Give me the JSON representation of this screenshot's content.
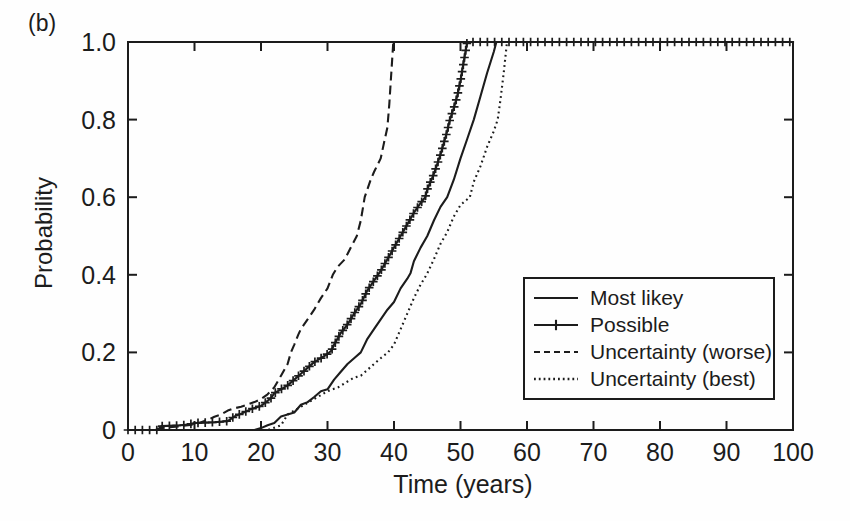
{
  "figure": {
    "panel_label": "(b)",
    "ink_color": "#1c1c1c",
    "paper_color": "#fefefe"
  },
  "chart_data": {
    "type": "line",
    "title": "",
    "xlabel": "Time (years)",
    "ylabel": "Probability",
    "xlim": [
      0,
      100
    ],
    "ylim": [
      0,
      1.0
    ],
    "x_ticks": [
      0,
      10,
      20,
      30,
      40,
      50,
      60,
      70,
      80,
      90,
      100
    ],
    "y_ticks": [
      0,
      0.2,
      0.4,
      0.6,
      0.8,
      1.0
    ],
    "y_tick_labels": [
      "0",
      "0.2",
      "0.4",
      "0.6",
      "0.8",
      "1.0"
    ],
    "grid": false,
    "legend_position": "inside lower-right",
    "series": [
      {
        "name": "Most likey",
        "line_style": "solid",
        "marker": "none",
        "points": [
          [
            0,
            0
          ],
          [
            19,
            0
          ],
          [
            20,
            0.005
          ],
          [
            21,
            0.012
          ],
          [
            22,
            0.018
          ],
          [
            23,
            0.035
          ],
          [
            24,
            0.04
          ],
          [
            25,
            0.045
          ],
          [
            26,
            0.065
          ],
          [
            27,
            0.072
          ],
          [
            28,
            0.085
          ],
          [
            29,
            0.1
          ],
          [
            30,
            0.105
          ],
          [
            31,
            0.13
          ],
          [
            32,
            0.15
          ],
          [
            33,
            0.17
          ],
          [
            34,
            0.185
          ],
          [
            35,
            0.2
          ],
          [
            36,
            0.235
          ],
          [
            37,
            0.26
          ],
          [
            38,
            0.285
          ],
          [
            39,
            0.31
          ],
          [
            40,
            0.33
          ],
          [
            41,
            0.365
          ],
          [
            42,
            0.39
          ],
          [
            42.5,
            0.405
          ],
          [
            43,
            0.435
          ],
          [
            44,
            0.47
          ],
          [
            45,
            0.5
          ],
          [
            46,
            0.54
          ],
          [
            47,
            0.575
          ],
          [
            48,
            0.6
          ],
          [
            49,
            0.645
          ],
          [
            50,
            0.7
          ],
          [
            51,
            0.75
          ],
          [
            52,
            0.8
          ],
          [
            53,
            0.86
          ],
          [
            54,
            0.92
          ],
          [
            55,
            0.975
          ],
          [
            55.4,
            1
          ],
          [
            100,
            1
          ]
        ]
      },
      {
        "name": "Possible",
        "line_style": "solid",
        "marker": "plus",
        "points": [
          [
            0,
            0
          ],
          [
            4.5,
            0
          ],
          [
            5,
            0.01
          ],
          [
            8,
            0.012
          ],
          [
            9,
            0.014
          ],
          [
            10,
            0.018
          ],
          [
            13,
            0.02
          ],
          [
            15,
            0.023
          ],
          [
            16,
            0.035
          ],
          [
            17,
            0.042
          ],
          [
            18,
            0.05
          ],
          [
            19,
            0.057
          ],
          [
            20,
            0.062
          ],
          [
            20.6,
            0.07
          ],
          [
            21.5,
            0.082
          ],
          [
            22,
            0.095
          ],
          [
            23,
            0.105
          ],
          [
            24,
            0.115
          ],
          [
            25,
            0.13
          ],
          [
            26,
            0.145
          ],
          [
            27,
            0.16
          ],
          [
            28,
            0.175
          ],
          [
            29,
            0.185
          ],
          [
            30,
            0.196
          ],
          [
            30.6,
            0.205
          ],
          [
            31,
            0.22
          ],
          [
            32,
            0.25
          ],
          [
            33,
            0.272
          ],
          [
            34,
            0.3
          ],
          [
            35,
            0.325
          ],
          [
            36,
            0.36
          ],
          [
            37,
            0.385
          ],
          [
            38,
            0.41
          ],
          [
            39,
            0.44
          ],
          [
            40,
            0.47
          ],
          [
            41,
            0.5
          ],
          [
            42,
            0.53
          ],
          [
            43,
            0.56
          ],
          [
            44,
            0.585
          ],
          [
            44.7,
            0.6
          ],
          [
            45,
            0.62
          ],
          [
            46,
            0.66
          ],
          [
            47,
            0.71
          ],
          [
            48,
            0.77
          ],
          [
            48.4,
            0.8
          ],
          [
            49,
            0.83
          ],
          [
            49.5,
            0.86
          ],
          [
            50,
            0.9
          ],
          [
            50.5,
            0.95
          ],
          [
            51,
            1
          ],
          [
            100,
            1
          ]
        ]
      },
      {
        "name": "Uncertainty (worse)",
        "line_style": "dashed",
        "marker": "none",
        "points": [
          [
            0,
            0
          ],
          [
            4,
            0
          ],
          [
            5,
            0.005
          ],
          [
            8,
            0.01
          ],
          [
            10,
            0.014
          ],
          [
            11,
            0.02
          ],
          [
            12,
            0.026
          ],
          [
            13,
            0.034
          ],
          [
            14,
            0.04
          ],
          [
            15,
            0.05
          ],
          [
            16,
            0.056
          ],
          [
            17,
            0.06
          ],
          [
            18,
            0.066
          ],
          [
            19,
            0.072
          ],
          [
            20,
            0.08
          ],
          [
            21,
            0.092
          ],
          [
            22,
            0.11
          ],
          [
            23,
            0.14
          ],
          [
            24,
            0.17
          ],
          [
            24.5,
            0.2
          ],
          [
            25,
            0.22
          ],
          [
            25.6,
            0.245
          ],
          [
            26,
            0.26
          ],
          [
            27,
            0.285
          ],
          [
            28,
            0.31
          ],
          [
            29,
            0.34
          ],
          [
            30,
            0.365
          ],
          [
            30.8,
            0.4
          ],
          [
            31.5,
            0.42
          ],
          [
            32.6,
            0.44
          ],
          [
            33.5,
            0.47
          ],
          [
            34.4,
            0.5
          ],
          [
            35,
            0.54
          ],
          [
            35.6,
            0.6
          ],
          [
            36.5,
            0.645
          ],
          [
            37,
            0.665
          ],
          [
            38,
            0.7
          ],
          [
            38.5,
            0.74
          ],
          [
            39,
            0.78
          ],
          [
            39.3,
            0.84
          ],
          [
            39.6,
            0.92
          ],
          [
            39.9,
            1
          ],
          [
            100,
            1
          ]
        ]
      },
      {
        "name": "Uncertainty (best)",
        "line_style": "dotted",
        "marker": "none",
        "points": [
          [
            0,
            0
          ],
          [
            21,
            0
          ],
          [
            22,
            0.006
          ],
          [
            23,
            0.012
          ],
          [
            24,
            0.04
          ],
          [
            25,
            0.05
          ],
          [
            26,
            0.06
          ],
          [
            27,
            0.07
          ],
          [
            28,
            0.08
          ],
          [
            29,
            0.09
          ],
          [
            30,
            0.1
          ],
          [
            31.6,
            0.11
          ],
          [
            33,
            0.125
          ],
          [
            34,
            0.135
          ],
          [
            35,
            0.14
          ],
          [
            36,
            0.155
          ],
          [
            37,
            0.17
          ],
          [
            38,
            0.185
          ],
          [
            39.1,
            0.2
          ],
          [
            40,
            0.22
          ],
          [
            41,
            0.26
          ],
          [
            42,
            0.3
          ],
          [
            43,
            0.34
          ],
          [
            44,
            0.375
          ],
          [
            44.9,
            0.4
          ],
          [
            46,
            0.44
          ],
          [
            47,
            0.48
          ],
          [
            48,
            0.51
          ],
          [
            49,
            0.55
          ],
          [
            50,
            0.58
          ],
          [
            51.4,
            0.6
          ],
          [
            52,
            0.64
          ],
          [
            53,
            0.68
          ],
          [
            54,
            0.73
          ],
          [
            55,
            0.77
          ],
          [
            55.6,
            0.8
          ],
          [
            56,
            0.85
          ],
          [
            56.5,
            0.92
          ],
          [
            57,
            1
          ],
          [
            100,
            1
          ]
        ]
      }
    ]
  }
}
